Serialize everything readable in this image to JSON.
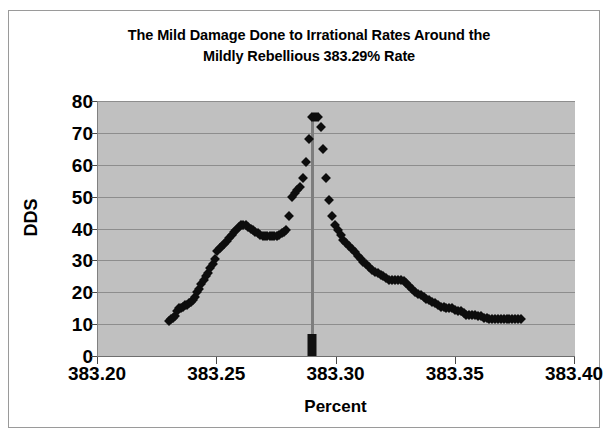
{
  "chart_data": {
    "type": "scatter",
    "title": "The Mild Damage Done to Irrational Rates Around the Mildly Rebellious 383.29% Rate",
    "title_line1": "The Mild Damage Done to Irrational Rates Around the",
    "title_line2": "Mildly Rebellious 383.29% Rate",
    "xlabel": "Percent",
    "ylabel": "DDS",
    "xlim": [
      383.2,
      383.4
    ],
    "ylim": [
      0,
      80
    ],
    "xticks": [
      "383.20",
      "383.25",
      "383.30",
      "383.35",
      "383.40"
    ],
    "xtick_values": [
      383.2,
      383.25,
      383.3,
      383.35,
      383.4
    ],
    "yticks": [
      "0",
      "10",
      "20",
      "30",
      "40",
      "50",
      "60",
      "70",
      "80"
    ],
    "ytick_values": [
      0,
      10,
      20,
      30,
      40,
      50,
      60,
      70,
      80
    ],
    "grid": "horizontal",
    "legend": "none",
    "plot_background": "#c0c0c0",
    "marker_color": "#0d0d0d",
    "marker_shape": "diamond",
    "annotation": {
      "name": "vertical-marker-at-383.29",
      "x": 383.2897,
      "color": "#7d7d7d",
      "label": "383.29"
    },
    "x": [
      383.2298,
      383.2305,
      383.2313,
      383.2321,
      383.2333,
      383.2341,
      383.2349,
      383.2357,
      383.2365,
      383.2373,
      383.2381,
      383.2389,
      383.2397,
      383.2406,
      383.2414,
      383.2424,
      383.2433,
      383.2443,
      383.2452,
      383.2462,
      383.2471,
      383.2481,
      383.249,
      383.25,
      383.251,
      383.252,
      383.253,
      383.254,
      383.255,
      383.256,
      383.257,
      383.258,
      383.259,
      383.26,
      383.261,
      383.262,
      383.263,
      383.264,
      383.265,
      383.266,
      383.267,
      383.268,
      383.269,
      383.27,
      383.271,
      383.272,
      383.273,
      383.274,
      383.275,
      383.276,
      383.277,
      383.278,
      383.279,
      383.28,
      383.2812,
      383.2824,
      383.2836,
      383.2848,
      383.286,
      383.2872,
      383.2884,
      383.2897,
      383.2905,
      383.2913,
      383.2921,
      383.2933,
      383.2945,
      383.2957,
      383.2969,
      383.2981,
      383.2993,
      383.3005,
      383.3017,
      383.3029,
      383.3041,
      383.3053,
      383.3065,
      383.3077,
      383.3089,
      383.3101,
      383.3113,
      383.3125,
      383.3137,
      383.3149,
      383.3161,
      383.3173,
      383.3185,
      383.3197,
      383.3209,
      383.3221,
      383.3233,
      383.3245,
      383.3257,
      383.3269,
      383.3281,
      383.3293,
      383.3305,
      383.3317,
      383.3329,
      383.3341,
      383.3353,
      383.3365,
      383.3377,
      383.3389,
      383.3401,
      383.3413,
      383.3425,
      383.3437,
      383.3449,
      383.3461,
      383.3473,
      383.3485,
      383.3497,
      383.3509,
      383.3521,
      383.3533,
      383.3545,
      383.3557,
      383.3569,
      383.3581,
      383.3593,
      383.3605,
      383.3617,
      383.3629,
      383.3641,
      383.3653,
      383.3665,
      383.3677,
      383.3689,
      383.3701,
      383.3713,
      383.3725,
      383.3737,
      383.3749,
      383.3761,
      383.3773
    ],
    "y": [
      11,
      11.5,
      12,
      12.5,
      14,
      15,
      15,
      15.5,
      16,
      16,
      16.5,
      17,
      17.5,
      18.5,
      20,
      21,
      22.5,
      24,
      25,
      26,
      27.5,
      29,
      30.5,
      33,
      34,
      34.5,
      35,
      36,
      37,
      38,
      39,
      39.5,
      40.5,
      41,
      41,
      41,
      40.5,
      40,
      39.5,
      39,
      38.5,
      38,
      37.5,
      37.5,
      37.5,
      37.5,
      37.5,
      37.5,
      37.5,
      38,
      38.5,
      39,
      39.5,
      44,
      50,
      51,
      52,
      53,
      56,
      61,
      68,
      75,
      75,
      75,
      75,
      72,
      65,
      56,
      49,
      44,
      41,
      39.5,
      38,
      36.5,
      35.5,
      34.5,
      33.5,
      32.5,
      31.5,
      30.5,
      29.5,
      29,
      28,
      27,
      26.5,
      26,
      25.5,
      25,
      24.5,
      24,
      24,
      24,
      24,
      24,
      23.5,
      23,
      22,
      21,
      20,
      19.5,
      19,
      18.5,
      18,
      17.5,
      17,
      16.5,
      16,
      15.5,
      15.5,
      15,
      15,
      15,
      14.5,
      14,
      14,
      13.5,
      13,
      13,
      13,
      13,
      12.5,
      12.5,
      12,
      12,
      11.5,
      11.5,
      11.5,
      11.5,
      11.5,
      11.5,
      11.5,
      11.5,
      11.5,
      11.5,
      11.5,
      11.5
    ]
  }
}
